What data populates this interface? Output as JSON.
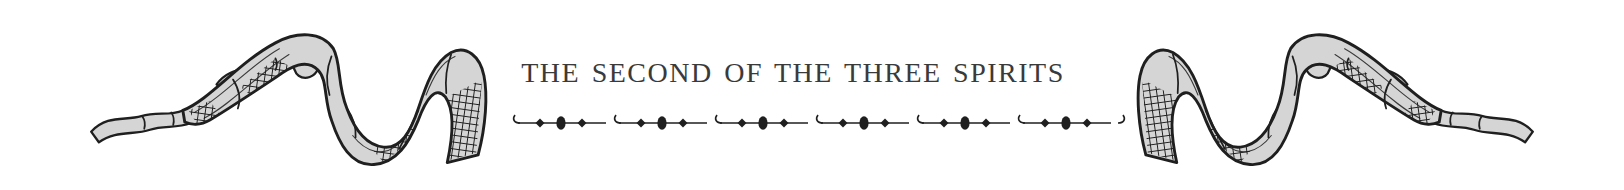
{
  "heading": {
    "title": "THE SECOND OF THE THREE SPIRITS"
  },
  "divider": {
    "segments": 6,
    "motif": "hook-line-diamond-oval-diamond-line",
    "color": "#1f1f1f"
  },
  "ornaments": {
    "left": "engraved-twisted-ribbon",
    "right": "engraved-twisted-ribbon-mirrored",
    "fill_color": "#d5d5d5",
    "ink_color": "#1f1f1f"
  },
  "page": {
    "background_color": "#ffffff",
    "title_color": "#3a3a3a"
  }
}
